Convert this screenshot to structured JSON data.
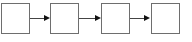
{
  "diagram": {
    "type": "flow",
    "nodes": [
      {
        "id": "box-1",
        "label": ""
      },
      {
        "id": "box-2",
        "label": ""
      },
      {
        "id": "box-3",
        "label": ""
      },
      {
        "id": "box-4",
        "label": ""
      }
    ],
    "edges": [
      {
        "from": "box-1",
        "to": "box-2"
      },
      {
        "from": "box-2",
        "to": "box-3"
      },
      {
        "from": "box-3",
        "to": "box-4"
      }
    ],
    "colors": {
      "border": "#6e6e6e",
      "arrow": "#111111",
      "background": "#ffffff"
    }
  }
}
